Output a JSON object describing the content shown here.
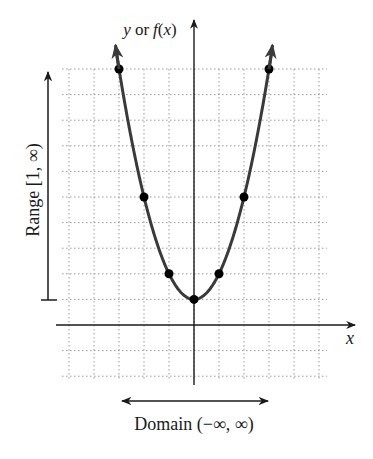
{
  "chart_data": {
    "type": "line",
    "function": "f(x) = x^2 + 1",
    "title": "",
    "xlabel": "x",
    "ylabel": "y or f(x)",
    "xlim": [
      -5,
      5
    ],
    "ylim": [
      -2,
      10
    ],
    "grid": true,
    "series": [
      {
        "name": "parabola",
        "x": [
          -3,
          -2,
          -1,
          0,
          1,
          2,
          3
        ],
        "y": [
          10,
          5,
          2,
          1,
          2,
          5,
          10
        ]
      }
    ],
    "annotations": [
      {
        "text": "Range [1, ∞)",
        "type": "vertical-arrow",
        "from_y": 1,
        "to_y": "infinity"
      },
      {
        "text": "Domain (−∞, ∞)",
        "type": "horizontal-double-arrow"
      }
    ]
  },
  "labels": {
    "y_axis": "y or ",
    "y_axis_fx": "f(x)",
    "x_axis": "x",
    "range": "Range [1, ∞)",
    "domain": "Domain (−∞, ∞)"
  },
  "colors": {
    "curve": "#3a3a3a",
    "axis": "#1a1a1a",
    "grid": "#9a9a9a",
    "point": "#000000"
  }
}
